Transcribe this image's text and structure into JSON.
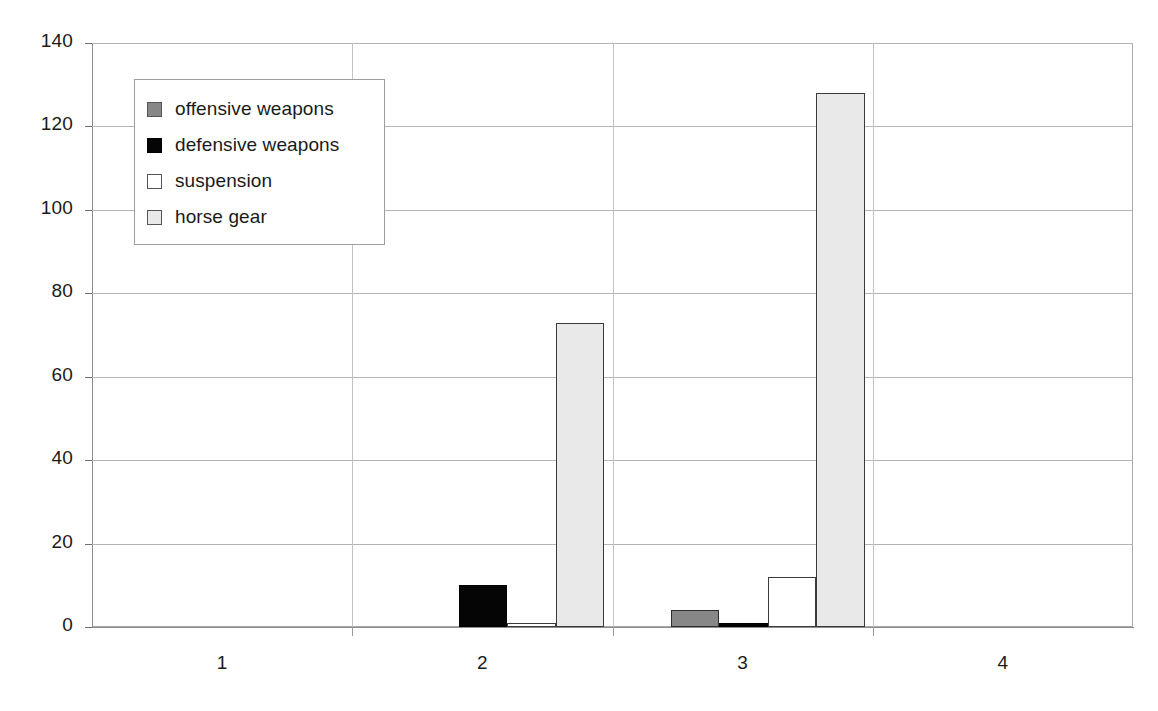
{
  "chart_data": {
    "type": "bar",
    "title": "",
    "subtitle": "",
    "xlabel": "",
    "ylabel": "",
    "categories": [
      "1",
      "2",
      "3",
      "4"
    ],
    "series": [
      {
        "name": "offensive weapons",
        "color": "#878787",
        "values": [
          0,
          0,
          4,
          0
        ]
      },
      {
        "name": "defensive weapons",
        "color": "#050505",
        "values": [
          0,
          10,
          1,
          0
        ]
      },
      {
        "name": "suspension",
        "color": "#ffffff",
        "values": [
          0,
          1,
          12,
          0
        ]
      },
      {
        "name": "horse gear",
        "color": "#e9e9e9",
        "values": [
          0,
          73,
          128,
          0
        ]
      }
    ],
    "ylim": [
      0,
      140
    ],
    "ytick_values": [
      0,
      20,
      40,
      60,
      80,
      100,
      120,
      140
    ],
    "ytick_labels": [
      "0",
      "20",
      "40",
      "60",
      "80",
      "100",
      "120",
      "140"
    ],
    "grid": true,
    "legend_position": "upper-left",
    "legend_entries": [
      "offensive weapons",
      "defensive weapons",
      "suspension",
      "horse gear"
    ],
    "annotations": []
  },
  "colors": {
    "offensive": "#878787",
    "defensive": "#050505",
    "suspension": "#ffffff",
    "horse_gear": "#e9e9e9",
    "gridline": "#b5b5b5",
    "axis": "#8d8d8d",
    "text": "#1a1a1a",
    "background": "#ffffff"
  }
}
